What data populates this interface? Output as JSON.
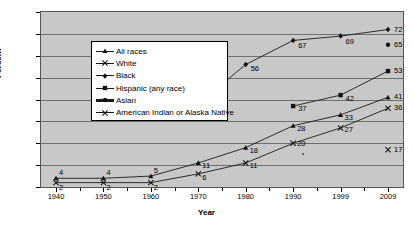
{
  "chart_data": {
    "type": "line",
    "title": "",
    "xlabel": "Year",
    "ylabel": "Percent",
    "categories": [
      "1940",
      "1950",
      "1960",
      "1970",
      "1980",
      "1990",
      "1999",
      "2009"
    ],
    "x": [
      1940,
      1950,
      1960,
      1970,
      1980,
      1990,
      1999,
      2009
    ],
    "ylim": [
      0,
      80
    ],
    "yticks": [
      "0",
      "10",
      "20",
      "30",
      "40",
      "50",
      "60",
      "70",
      "80"
    ],
    "grid": "horizontal",
    "legend_position": "upper-left-inside",
    "series": [
      {
        "name": "All races",
        "marker": "triangle",
        "values": [
          4,
          4,
          5,
          11,
          18,
          28,
          33,
          41
        ],
        "labels": [
          "4",
          "4",
          "5",
          "11",
          "18",
          "28",
          "33",
          "41"
        ]
      },
      {
        "name": "White",
        "marker": "x",
        "values": [
          2,
          2,
          2,
          6,
          11,
          20,
          27,
          36
        ],
        "labels": [
          "2",
          "2",
          "2",
          "6",
          "11",
          "20",
          "27",
          "36"
        ]
      },
      {
        "name": "Black",
        "marker": "diamond",
        "values": [
          null,
          null,
          null,
          38,
          56,
          67,
          69,
          72
        ],
        "labels": [
          "",
          "",
          "",
          "38",
          "56",
          "67",
          "69",
          "72"
        ]
      },
      {
        "name": "Hispanic (any race)",
        "marker": "square",
        "values": [
          null,
          null,
          null,
          null,
          null,
          37,
          42,
          53
        ],
        "labels": [
          "",
          "",
          "",
          "",
          "",
          "37",
          "42",
          "53"
        ]
      },
      {
        "name": "Asian",
        "marker": "circle-bar",
        "values": [
          null,
          null,
          null,
          null,
          null,
          null,
          null,
          65
        ],
        "labels": [
          "",
          "",
          "",
          "",
          "",
          "",
          "",
          "65"
        ]
      },
      {
        "name": "American Indian or Alaska Native",
        "marker": "x",
        "values": [
          null,
          null,
          null,
          null,
          null,
          null,
          null,
          17
        ],
        "labels": [
          "",
          "",
          "",
          "",
          "",
          "",
          "",
          "17"
        ]
      }
    ],
    "colors": {
      "plot_background": "#c8c8c8",
      "figure_background": "#ffffff",
      "line": "#1a1a1a",
      "grid": "#6f6f6f",
      "axis": "#000000"
    }
  }
}
